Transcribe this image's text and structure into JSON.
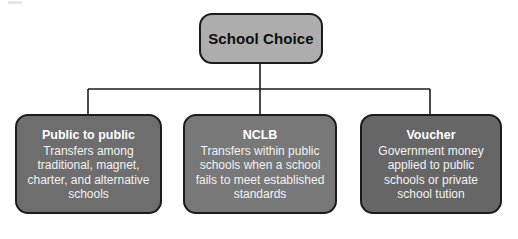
{
  "diagram": {
    "type": "hierarchy-tree",
    "title": "School Choice",
    "root": {
      "label": "School Choice",
      "fill": "#adadad",
      "text_color": "#0d0d0d"
    },
    "children": [
      {
        "title": "Public to public",
        "description": "Transfers among traditional, magnet, charter, and alternative schools",
        "fill": "#6e6e6e",
        "text_color": "#ffffff"
      },
      {
        "title": "NCLB",
        "description": "Transfers within public schools when a school fails to meet established standards",
        "fill": "#787878",
        "text_color": "#ffffff"
      },
      {
        "title": "Voucher",
        "description": "Government money applied to public schools or private school tution",
        "fill": "#666666",
        "text_color": "#ffffff"
      }
    ],
    "connector_color": "#1c1c1c",
    "background": "#ffffff"
  }
}
